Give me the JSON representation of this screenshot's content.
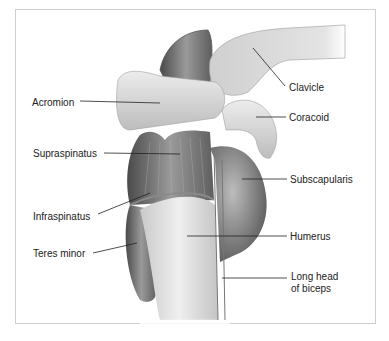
{
  "figure": {
    "labels": [
      {
        "id": "clavicle",
        "text": "Clavicle",
        "x": 289,
        "y": 82
      },
      {
        "id": "acromion",
        "text": "Acromion",
        "x": 32,
        "y": 97
      },
      {
        "id": "coracoid",
        "text": "Coracoid",
        "x": 289,
        "y": 112
      },
      {
        "id": "supraspinatus",
        "text": "Supraspinatus",
        "x": 33,
        "y": 148
      },
      {
        "id": "subscapularis",
        "text": "Subscapularis",
        "x": 290,
        "y": 174
      },
      {
        "id": "infraspinatus",
        "text": "Infraspinatus",
        "x": 33,
        "y": 211
      },
      {
        "id": "humerus",
        "text": "Humerus",
        "x": 290,
        "y": 231
      },
      {
        "id": "teres_minor",
        "text": "Teres minor",
        "x": 33,
        "y": 248
      },
      {
        "id": "long_head_biceps_1",
        "text": "Long head",
        "x": 291,
        "y": 271
      },
      {
        "id": "long_head_biceps_2",
        "text": "of biceps",
        "x": 291,
        "y": 283
      }
    ]
  },
  "colors": {
    "border": "#cfcfcf",
    "bone": "#dcdcdc",
    "muscle_dark": "#5a5a5a",
    "leader": "#222222"
  }
}
